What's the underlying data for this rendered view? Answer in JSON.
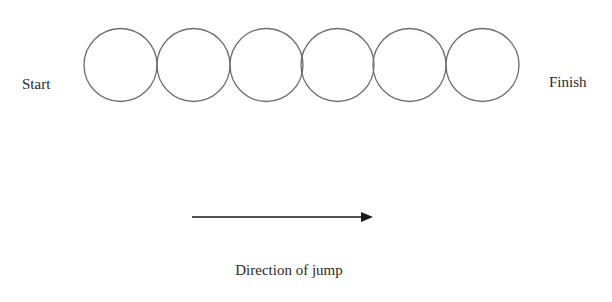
{
  "diagram": {
    "start_label": "Start",
    "finish_label": "Finish",
    "circle_count": 6,
    "circles": [
      {
        "index": 1,
        "cx": 120.5,
        "cy": 65,
        "r": 36.5
      },
      {
        "index": 2,
        "cx": 193.5,
        "cy": 65,
        "r": 36.5
      },
      {
        "index": 3,
        "cx": 266.5,
        "cy": 65,
        "r": 36.5
      },
      {
        "index": 4,
        "cx": 337.5,
        "cy": 65,
        "r": 36.5
      },
      {
        "index": 5,
        "cx": 409.5,
        "cy": 65,
        "r": 36.5
      },
      {
        "index": 6,
        "cx": 482.5,
        "cy": 65,
        "r": 36.5
      }
    ],
    "arrow": {
      "x1": 192,
      "y1": 217,
      "x2": 373,
      "y2": 217,
      "direction": "right"
    },
    "caption": "Direction of jump",
    "colors": {
      "stroke": "#6e6e6e",
      "arrow": "#1a1a1a",
      "text": "#2a2a2a",
      "background": "#ffffff"
    }
  }
}
